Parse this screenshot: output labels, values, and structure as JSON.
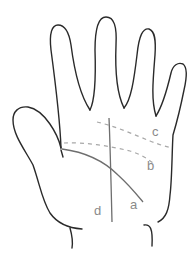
{
  "figure": {
    "colors": {
      "outline": "#2a2a2a",
      "solid_line": "#6e6e6e",
      "dashed_line": "#a8a8a8",
      "label": "#8a8a8a",
      "background": "#ffffff"
    },
    "labels": {
      "a": "a",
      "b": "b",
      "c": "c",
      "d": "d"
    },
    "lines": [
      {
        "id": "a",
        "style": "solid",
        "kind": "curved line across palm"
      },
      {
        "id": "b",
        "style": "dashed",
        "kind": "lower horizontal line"
      },
      {
        "id": "c",
        "style": "dashed",
        "kind": "upper slanted line"
      },
      {
        "id": "d",
        "style": "solid",
        "kind": "vertical line"
      }
    ]
  }
}
